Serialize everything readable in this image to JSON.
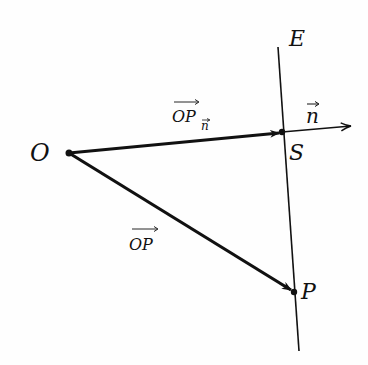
{
  "diagram": {
    "type": "vector-projection",
    "colors": {
      "stroke": "#111111",
      "background": "#fefefe"
    },
    "points": {
      "O": {
        "label": "O",
        "x": 69,
        "y": 153
      },
      "S": {
        "label": "S",
        "x": 282,
        "y": 132
      },
      "P": {
        "label": "P",
        "x": 294,
        "y": 292
      }
    },
    "plane": {
      "label": "E",
      "top": {
        "x": 278,
        "y": 47
      },
      "bottom": {
        "x": 299,
        "y": 351
      }
    },
    "vectors": {
      "OPn": {
        "label_main": "OP",
        "label_sub": "n",
        "from": "O",
        "to": "S"
      },
      "OP": {
        "label": "OP",
        "from": "O",
        "to": "P"
      },
      "n": {
        "label": "n",
        "from": "S",
        "tip": {
          "x": 352,
          "y": 126
        }
      }
    }
  }
}
